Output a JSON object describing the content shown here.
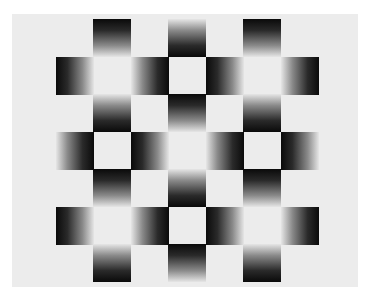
{
  "image": {
    "description": "Optical illusion: checkerboard of gradient squares on a light gray field",
    "background_color": "#ffffff",
    "board_color": "#ececec",
    "dark_color": "#0a0a0a",
    "grid": {
      "rows": 7,
      "cols": 7,
      "origin_x": 55.5,
      "origin_y": 19,
      "cell_size": 37.5
    },
    "cells": [
      {
        "row": 0,
        "col": 1,
        "dark": "top"
      },
      {
        "row": 0,
        "col": 3,
        "dark": "bottom"
      },
      {
        "row": 0,
        "col": 5,
        "dark": "top"
      },
      {
        "row": 1,
        "col": 0,
        "dark": "left"
      },
      {
        "row": 1,
        "col": 2,
        "dark": "right"
      },
      {
        "row": 1,
        "col": 4,
        "dark": "left"
      },
      {
        "row": 1,
        "col": 6,
        "dark": "right"
      },
      {
        "row": 2,
        "col": 1,
        "dark": "bottom"
      },
      {
        "row": 2,
        "col": 3,
        "dark": "top"
      },
      {
        "row": 2,
        "col": 5,
        "dark": "bottom"
      },
      {
        "row": 3,
        "col": 0,
        "dark": "right"
      },
      {
        "row": 3,
        "col": 2,
        "dark": "left"
      },
      {
        "row": 3,
        "col": 4,
        "dark": "right"
      },
      {
        "row": 3,
        "col": 6,
        "dark": "left"
      },
      {
        "row": 4,
        "col": 1,
        "dark": "top"
      },
      {
        "row": 4,
        "col": 3,
        "dark": "bottom"
      },
      {
        "row": 4,
        "col": 5,
        "dark": "top"
      },
      {
        "row": 5,
        "col": 0,
        "dark": "left"
      },
      {
        "row": 5,
        "col": 2,
        "dark": "right"
      },
      {
        "row": 5,
        "col": 4,
        "dark": "left"
      },
      {
        "row": 5,
        "col": 6,
        "dark": "right"
      },
      {
        "row": 6,
        "col": 1,
        "dark": "bottom"
      },
      {
        "row": 6,
        "col": 3,
        "dark": "top"
      },
      {
        "row": 6,
        "col": 5,
        "dark": "bottom"
      }
    ]
  }
}
